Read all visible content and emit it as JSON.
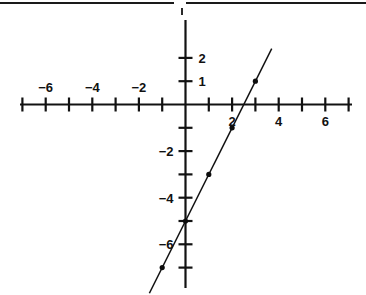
{
  "figure": {
    "kind": "cartesian-line-graph",
    "width": 366,
    "height": 295,
    "background": "#ffffff",
    "ink_color": "#121212",
    "top_rule_present": true
  },
  "chart_data": {
    "type": "line",
    "title": "",
    "subtitle": "",
    "xlabel": "",
    "ylabel": "",
    "grid": false,
    "legend": "none",
    "xlim": [
      -7.5,
      7.5
    ],
    "ylim": [
      -8,
      3
    ],
    "x_tick_step": 1,
    "y_tick_step": 1,
    "x_tick_labels": [
      "-6",
      "-4",
      "-2",
      "2",
      "4",
      "6"
    ],
    "x_tick_label_values": [
      -6,
      -4,
      -2,
      2,
      4,
      6
    ],
    "y_tick_labels": [
      "2",
      "1",
      "-2",
      "-4",
      "-6"
    ],
    "y_tick_label_values": [
      2,
      1,
      -2,
      -4,
      -6
    ],
    "negative_x_labels_above_axis": true,
    "positive_x_labels_below_axis": true,
    "positive_y_labels_right_of_axis": true,
    "negative_y_labels_left_of_axis": true,
    "series": [
      {
        "name": "line",
        "equation": "y = 2x - 5",
        "slope": 2,
        "intercept": -5,
        "marked_points": [
          {
            "x": -1,
            "y": -7
          },
          {
            "x": 0,
            "y": -5
          },
          {
            "x": 1,
            "y": -3
          },
          {
            "x": 2,
            "y": -1
          },
          {
            "x": 3,
            "y": 1
          }
        ],
        "drawn_from": {
          "x": -1.55,
          "y": -8.1
        },
        "drawn_to": {
          "x": 3.7,
          "y": 2.4
        }
      }
    ]
  },
  "labels": {
    "x_neg": [
      {
        "text": "−6",
        "value": -6
      },
      {
        "text": "−4",
        "value": -4
      },
      {
        "text": "−2",
        "value": -2
      }
    ],
    "x_pos": [
      {
        "text": "2",
        "value": 2
      },
      {
        "text": "4",
        "value": 4
      },
      {
        "text": "6",
        "value": 6
      }
    ],
    "y_pos": [
      {
        "text": "2",
        "value": 2
      },
      {
        "text": "1",
        "value": 1
      }
    ],
    "y_neg": [
      {
        "text": "−2",
        "value": -2
      },
      {
        "text": "−4",
        "value": -4
      },
      {
        "text": "−6",
        "value": -6
      }
    ]
  }
}
